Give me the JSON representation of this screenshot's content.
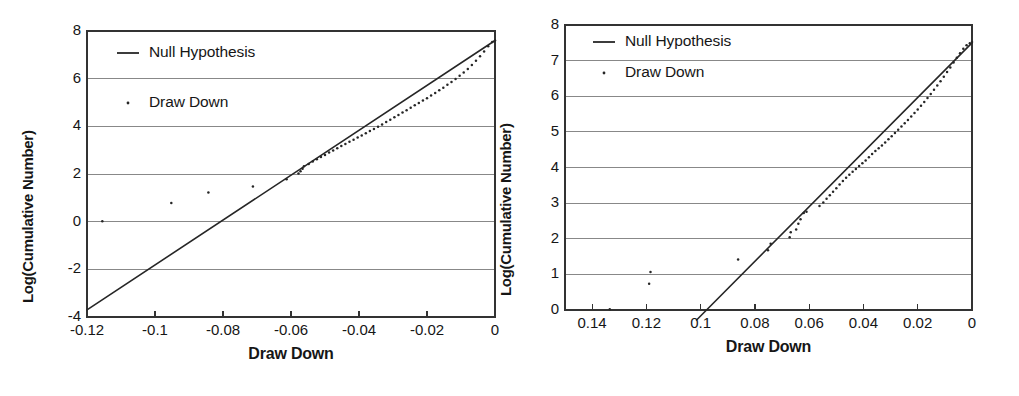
{
  "figure": {
    "background": "#ffffff",
    "panel_count": 2,
    "ink_color": "#262626",
    "grid_color": "#888888",
    "axis_color": "#333333"
  },
  "chart_data": [
    {
      "id": "left",
      "type": "scatter",
      "title": "",
      "xlabel": "Draw Down",
      "ylabel": "Log(Cumulative Number)",
      "xlim": [
        -0.12,
        0
      ],
      "ylim": [
        -4,
        8
      ],
      "xticks": [
        -0.12,
        -0.1,
        -0.08,
        -0.06,
        -0.04,
        -0.02,
        0
      ],
      "xticklabels": [
        "-0.12",
        "-0.1",
        "-0.08",
        "-0.06",
        "-0.04",
        "-0.02",
        "0"
      ],
      "yticks": [
        -4,
        -2,
        0,
        2,
        4,
        6,
        8
      ],
      "yticklabels": [
        "-4",
        "-2",
        "0",
        "2",
        "4",
        "6",
        "8"
      ],
      "grid": "horizontal",
      "legend_position": "top-left",
      "legend": [
        {
          "label": "Null Hypothesis",
          "marker": "line"
        },
        {
          "label": "Draw Down",
          "marker": "dot"
        }
      ],
      "series": [
        {
          "name": "Null Hypothesis",
          "type": "line",
          "x": [
            -0.12,
            0
          ],
          "y": [
            -3.7,
            7.6
          ]
        },
        {
          "name": "Draw Down",
          "type": "scatter",
          "points": [
            [
              -0.1155,
              0.02
            ],
            [
              -0.0952,
              0.78
            ],
            [
              -0.0843,
              1.22
            ],
            [
              -0.0712,
              1.48
            ],
            [
              -0.0613,
              1.78
            ],
            [
              -0.0578,
              2.02
            ],
            [
              -0.0572,
              2.12
            ],
            [
              -0.0566,
              2.22
            ],
            [
              -0.0562,
              2.33
            ],
            [
              -0.0548,
              2.42
            ],
            [
              -0.0536,
              2.52
            ],
            [
              -0.0524,
              2.62
            ],
            [
              -0.0512,
              2.71
            ],
            [
              -0.05,
              2.8
            ],
            [
              -0.0488,
              2.9
            ],
            [
              -0.0476,
              2.99
            ],
            [
              -0.0464,
              3.08
            ],
            [
              -0.0452,
              3.17
            ],
            [
              -0.044,
              3.26
            ],
            [
              -0.0428,
              3.35
            ],
            [
              -0.0416,
              3.44
            ],
            [
              -0.0404,
              3.53
            ],
            [
              -0.0392,
              3.62
            ],
            [
              -0.038,
              3.71
            ],
            [
              -0.0368,
              3.8
            ],
            [
              -0.0356,
              3.89
            ],
            [
              -0.0344,
              3.98
            ],
            [
              -0.0332,
              4.08
            ],
            [
              -0.032,
              4.18
            ],
            [
              -0.0308,
              4.28
            ],
            [
              -0.0296,
              4.38
            ],
            [
              -0.0284,
              4.48
            ],
            [
              -0.0272,
              4.58
            ],
            [
              -0.026,
              4.68
            ],
            [
              -0.0248,
              4.78
            ],
            [
              -0.0236,
              4.88
            ],
            [
              -0.0224,
              4.98
            ],
            [
              -0.0212,
              5.08
            ],
            [
              -0.02,
              5.18
            ],
            [
              -0.0188,
              5.29
            ],
            [
              -0.0176,
              5.4
            ],
            [
              -0.0164,
              5.51
            ],
            [
              -0.0152,
              5.62
            ],
            [
              -0.014,
              5.74
            ],
            [
              -0.0128,
              5.86
            ],
            [
              -0.0116,
              5.99
            ],
            [
              -0.0104,
              6.12
            ],
            [
              -0.0092,
              6.26
            ],
            [
              -0.008,
              6.41
            ],
            [
              -0.0068,
              6.57
            ],
            [
              -0.0056,
              6.75
            ],
            [
              -0.0044,
              6.94
            ],
            [
              -0.0032,
              7.14
            ],
            [
              -0.002,
              7.36
            ],
            [
              -0.0008,
              7.54
            ],
            [
              0.0,
              7.6
            ]
          ]
        }
      ]
    },
    {
      "id": "right",
      "type": "scatter",
      "title": "",
      "xlabel": "Draw Down",
      "ylabel": "Log(Cumulative Number)",
      "xlim": [
        0.15,
        0
      ],
      "ylim": [
        0,
        8
      ],
      "x_axis_reversed": true,
      "xticks": [
        0.14,
        0.12,
        0.1,
        0.08,
        0.06,
        0.04,
        0.02,
        0
      ],
      "xticklabels": [
        "0.14",
        "0.12",
        "0.1",
        "0.08",
        "0.06",
        "0.04",
        "0.02",
        "0"
      ],
      "yticks": [
        0,
        1,
        2,
        3,
        4,
        5,
        6,
        7,
        8
      ],
      "yticklabels": [
        "0",
        "1",
        "2",
        "3",
        "4",
        "5",
        "6",
        "7",
        "8"
      ],
      "grid": "horizontal",
      "legend_position": "top-left",
      "legend": [
        {
          "label": "Null Hypothesis",
          "marker": "line"
        },
        {
          "label": "Draw Down",
          "marker": "dot"
        }
      ],
      "series": [
        {
          "name": "Null Hypothesis",
          "type": "line",
          "x": [
            0.1015,
            0
          ],
          "y": [
            -0.28,
            7.5
          ]
        },
        {
          "name": "Draw Down",
          "type": "scatter",
          "points": [
            [
              0.1335,
              0.02
            ],
            [
              0.1185,
              1.07
            ],
            [
              0.119,
              0.74
            ],
            [
              0.0862,
              1.42
            ],
            [
              0.0752,
              1.68
            ],
            [
              0.0742,
              1.86
            ],
            [
              0.0672,
              2.04
            ],
            [
              0.0668,
              2.18
            ],
            [
              0.0648,
              2.26
            ],
            [
              0.064,
              2.42
            ],
            [
              0.0632,
              2.55
            ],
            [
              0.062,
              2.72
            ],
            [
              0.061,
              2.76
            ],
            [
              0.0562,
              2.92
            ],
            [
              0.0548,
              3.02
            ],
            [
              0.0536,
              3.12
            ],
            [
              0.0524,
              3.22
            ],
            [
              0.0512,
              3.32
            ],
            [
              0.05,
              3.42
            ],
            [
              0.0488,
              3.52
            ],
            [
              0.0476,
              3.62
            ],
            [
              0.0464,
              3.71
            ],
            [
              0.0452,
              3.8
            ],
            [
              0.044,
              3.88
            ],
            [
              0.0428,
              3.96
            ],
            [
              0.0416,
              4.04
            ],
            [
              0.0404,
              4.12
            ],
            [
              0.0392,
              4.2
            ],
            [
              0.038,
              4.29
            ],
            [
              0.0368,
              4.38
            ],
            [
              0.0356,
              4.46
            ],
            [
              0.0344,
              4.54
            ],
            [
              0.0332,
              4.62
            ],
            [
              0.032,
              4.7
            ],
            [
              0.0308,
              4.79
            ],
            [
              0.0296,
              4.88
            ],
            [
              0.0284,
              4.97
            ],
            [
              0.0272,
              5.06
            ],
            [
              0.026,
              5.15
            ],
            [
              0.0248,
              5.24
            ],
            [
              0.0236,
              5.33
            ],
            [
              0.0224,
              5.43
            ],
            [
              0.0212,
              5.53
            ],
            [
              0.02,
              5.63
            ],
            [
              0.0188,
              5.73
            ],
            [
              0.0176,
              5.84
            ],
            [
              0.0164,
              5.95
            ],
            [
              0.0152,
              6.06
            ],
            [
              0.014,
              6.18
            ],
            [
              0.0128,
              6.3
            ],
            [
              0.0116,
              6.42
            ],
            [
              0.0104,
              6.55
            ],
            [
              0.0092,
              6.68
            ],
            [
              0.008,
              6.81
            ],
            [
              0.0068,
              6.95
            ],
            [
              0.0056,
              7.08
            ],
            [
              0.0044,
              7.21
            ],
            [
              0.0032,
              7.33
            ],
            [
              0.002,
              7.43
            ],
            [
              0.0008,
              7.49
            ],
            [
              0.0,
              7.52
            ]
          ]
        }
      ]
    }
  ]
}
